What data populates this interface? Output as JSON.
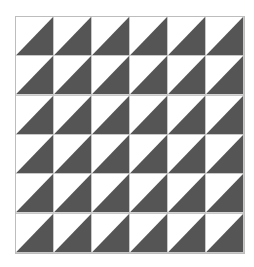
{
  "pattern": {
    "rows": 6,
    "columns": 6,
    "cell_shape": "half-square triangle",
    "light_color": "#ffffff",
    "dark_color": "#555555",
    "grid_line_color": "#c8c8c8",
    "orientation": "light upper-left, dark lower-right"
  }
}
